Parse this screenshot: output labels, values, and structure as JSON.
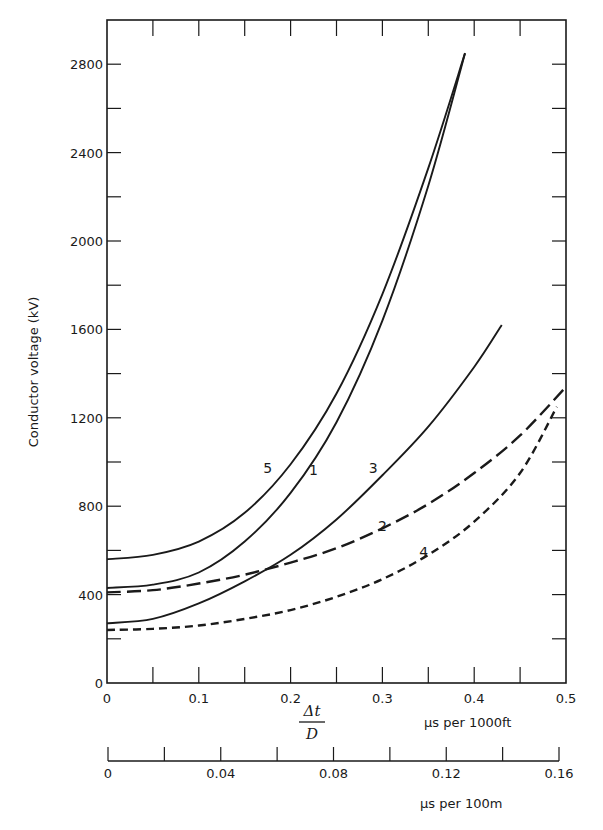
{
  "chart_data": {
    "type": "line",
    "title": "",
    "ylabel": "Conductor voltage (kV)",
    "xlabel": "Δt / D",
    "xlabel_numerator": "Δt",
    "xlabel_denominator": "D",
    "xlabel_units": "µs per 1000ft",
    "secondary_xlabel_units": "µs per 100m",
    "xlim": [
      0,
      0.5
    ],
    "ylim": [
      0,
      3000
    ],
    "grid": false,
    "legend": "inline curve labels",
    "x_ticks": [
      0,
      0.1,
      0.2,
      0.3,
      0.4,
      0.5
    ],
    "x_tick_labels": [
      "0",
      "0.1",
      "0.2",
      "0.3",
      "0.4",
      "0.5"
    ],
    "x_minor_tick_step": 0.05,
    "y_ticks": [
      0,
      400,
      800,
      1200,
      1600,
      2000,
      2400,
      2800
    ],
    "y_tick_labels": [
      "0",
      "400",
      "800",
      "1200",
      "1600",
      "2000",
      "2400",
      "2800"
    ],
    "y_minor_tick_step": 200,
    "secondary_x_axis": {
      "xlim": [
        0,
        0.16
      ],
      "ticks": [
        0,
        0.04,
        0.08,
        0.12,
        0.16
      ],
      "tick_labels": [
        "0",
        "0.04",
        "0.08",
        "0.12",
        "0.16"
      ],
      "minor_tick_step": 0.02,
      "units": "µs per 100m"
    },
    "series": [
      {
        "name": "1",
        "style": "solid",
        "x": [
          0,
          0.05,
          0.1,
          0.15,
          0.2,
          0.25,
          0.3,
          0.35,
          0.39
        ],
        "y": [
          430,
          445,
          500,
          640,
          860,
          1180,
          1640,
          2250,
          2850
        ]
      },
      {
        "name": "2",
        "style": "long-dash",
        "x": [
          0,
          0.05,
          0.1,
          0.15,
          0.2,
          0.25,
          0.3,
          0.35,
          0.4,
          0.45,
          0.5
        ],
        "y": [
          410,
          420,
          450,
          490,
          545,
          610,
          700,
          810,
          950,
          1120,
          1340
        ]
      },
      {
        "name": "3",
        "style": "solid",
        "x": [
          0,
          0.05,
          0.1,
          0.15,
          0.2,
          0.25,
          0.3,
          0.35,
          0.4,
          0.43
        ],
        "y": [
          270,
          290,
          360,
          460,
          580,
          740,
          940,
          1160,
          1430,
          1620
        ]
      },
      {
        "name": "4",
        "style": "short-dash",
        "x": [
          0,
          0.05,
          0.1,
          0.15,
          0.2,
          0.25,
          0.3,
          0.35,
          0.4,
          0.45,
          0.49
        ],
        "y": [
          240,
          245,
          260,
          290,
          330,
          390,
          470,
          580,
          730,
          950,
          1250
        ]
      },
      {
        "name": "5",
        "style": "solid",
        "x": [
          0,
          0.05,
          0.1,
          0.15,
          0.2,
          0.25,
          0.3,
          0.35,
          0.39
        ],
        "y": [
          560,
          580,
          640,
          770,
          990,
          1310,
          1760,
          2330,
          2850
        ]
      }
    ],
    "curve_labels": [
      {
        "text": "5",
        "x": 0.175,
        "y": 950
      },
      {
        "text": "1",
        "x": 0.225,
        "y": 940
      },
      {
        "text": "3",
        "x": 0.29,
        "y": 950
      },
      {
        "text": "2",
        "x": 0.3,
        "y": 690
      },
      {
        "text": "4",
        "x": 0.345,
        "y": 570
      }
    ]
  }
}
